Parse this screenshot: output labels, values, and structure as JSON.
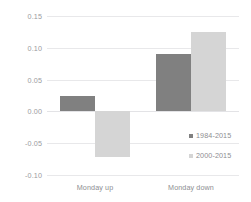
{
  "chart_data": {
    "type": "bar",
    "title": "",
    "subtitle": "",
    "xlabel": "",
    "ylabel": "",
    "categories": [
      "Monday up",
      "Monday down"
    ],
    "series": [
      {
        "name": "1984-2015",
        "color": "#808080",
        "values": [
          0.024,
          0.09
        ]
      },
      {
        "name": "2000-2015",
        "color": "#d5d5d5",
        "values": [
          -0.072,
          0.125
        ]
      }
    ],
    "ylim": [
      -0.1,
      0.15
    ],
    "yticks": [
      0.15,
      0.1,
      0.05,
      0.0,
      -0.05,
      -0.1
    ],
    "ytick_labels": [
      "0.15",
      "0.10",
      "0.05",
      "0.00",
      "-0.05",
      "-0.10"
    ],
    "grid": true,
    "legend_position": "center-right",
    "annotations": []
  }
}
